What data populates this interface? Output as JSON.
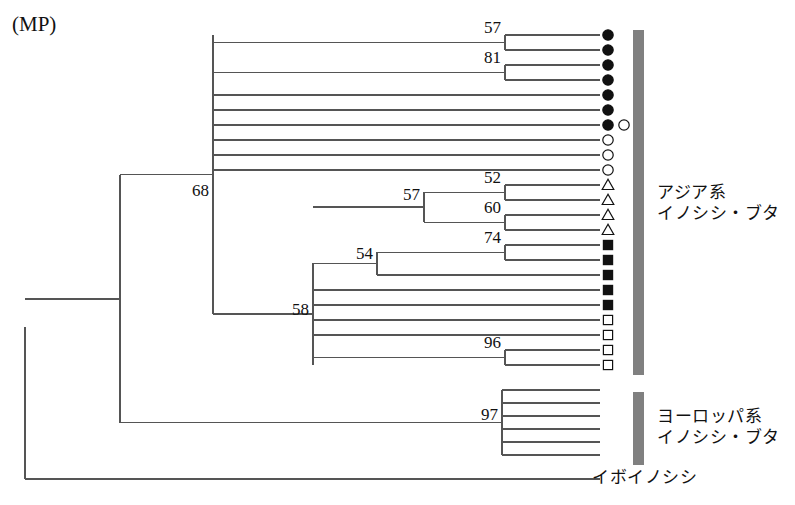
{
  "figure": {
    "method_label": "(MP)",
    "width": 795,
    "height": 505,
    "line_color": "#555555",
    "text_color": "#111111",
    "bar_color": "#808080",
    "background": "#ffffff"
  },
  "groups": [
    {
      "id": "asian",
      "line1": "アジア系",
      "line2": "イノシシ・ブタ",
      "bar": {
        "x": 633,
        "y": 30,
        "width": 11,
        "height": 345
      },
      "label_x": 657,
      "label_y": 182
    },
    {
      "id": "european",
      "line1": "ヨーロッパ系",
      "line2": "イノシシ・ブタ",
      "bar": {
        "x": 633,
        "y": 392,
        "width": 11,
        "height": 73
      },
      "label_x": 657,
      "label_y": 406
    }
  ],
  "outgroup": {
    "id": "warthog",
    "label": "イボイノシシ",
    "label_x": 592,
    "label_y": 479
  },
  "chart_data": {
    "type": "tree",
    "title": "(MP)",
    "tip_count": 30,
    "tip_spacing": 15,
    "first_tip_y": 35,
    "tip_x": 600,
    "marker_x": 608,
    "bootstrap_values": [
      57,
      81,
      68,
      57,
      52,
      60,
      54,
      74,
      58,
      96,
      97
    ],
    "marker_legend": [
      {
        "symbol": "filled-circle",
        "count": 7
      },
      {
        "symbol": "open-circle",
        "count": 4
      },
      {
        "symbol": "open-triangle",
        "count": 4
      },
      {
        "symbol": "filled-square",
        "count": 5
      },
      {
        "symbol": "open-square",
        "count": 4
      },
      {
        "symbol": "none",
        "count": 7
      }
    ],
    "tips": [
      {
        "index": 0,
        "y": 35,
        "marker": "filled-circle",
        "extra_marker": null
      },
      {
        "index": 1,
        "y": 50,
        "marker": "filled-circle",
        "extra_marker": null
      },
      {
        "index": 2,
        "y": 65,
        "marker": "filled-circle",
        "extra_marker": null
      },
      {
        "index": 3,
        "y": 80,
        "marker": "filled-circle",
        "extra_marker": null
      },
      {
        "index": 4,
        "y": 95,
        "marker": "filled-circle",
        "extra_marker": null
      },
      {
        "index": 5,
        "y": 110,
        "marker": "filled-circle",
        "extra_marker": null
      },
      {
        "index": 6,
        "y": 125,
        "marker": "filled-circle",
        "extra_marker": "open-circle"
      },
      {
        "index": 7,
        "y": 140,
        "marker": "open-circle",
        "extra_marker": null
      },
      {
        "index": 8,
        "y": 155,
        "marker": "open-circle",
        "extra_marker": null
      },
      {
        "index": 9,
        "y": 170,
        "marker": "open-circle",
        "extra_marker": null
      },
      {
        "index": 10,
        "y": 185,
        "marker": "open-triangle",
        "extra_marker": null
      },
      {
        "index": 11,
        "y": 200,
        "marker": "open-triangle",
        "extra_marker": null
      },
      {
        "index": 12,
        "y": 215,
        "marker": "open-triangle",
        "extra_marker": null
      },
      {
        "index": 13,
        "y": 230,
        "marker": "open-triangle",
        "extra_marker": null
      },
      {
        "index": 14,
        "y": 245,
        "marker": "filled-square",
        "extra_marker": null
      },
      {
        "index": 15,
        "y": 260,
        "marker": "filled-square",
        "extra_marker": null
      },
      {
        "index": 16,
        "y": 275,
        "marker": "filled-square",
        "extra_marker": null
      },
      {
        "index": 17,
        "y": 290,
        "marker": "filled-square",
        "extra_marker": null
      },
      {
        "index": 18,
        "y": 305,
        "marker": "filled-square",
        "extra_marker": null
      },
      {
        "index": 19,
        "y": 320,
        "marker": "open-square",
        "extra_marker": null
      },
      {
        "index": 20,
        "y": 335,
        "marker": "open-square",
        "extra_marker": null
      },
      {
        "index": 21,
        "y": 350,
        "marker": "open-square",
        "extra_marker": null
      },
      {
        "index": 22,
        "y": 365,
        "marker": "open-square",
        "extra_marker": null
      },
      {
        "index": 23,
        "y": 390,
        "marker": "none",
        "extra_marker": null
      },
      {
        "index": 24,
        "y": 403,
        "marker": "none",
        "extra_marker": null
      },
      {
        "index": 25,
        "y": 416,
        "marker": "none",
        "extra_marker": null
      },
      {
        "index": 26,
        "y": 429,
        "marker": "none",
        "extra_marker": null
      },
      {
        "index": 27,
        "y": 442,
        "marker": "none",
        "extra_marker": null
      },
      {
        "index": 28,
        "y": 455,
        "marker": "none",
        "extra_marker": null
      },
      {
        "index": 29,
        "y": 479,
        "marker": "none",
        "extra_marker": null
      }
    ],
    "nodes": [
      {
        "id": "n57a",
        "x": 505,
        "y_top": 35,
        "y_bot": 50,
        "parent_x": 213,
        "label": "57",
        "label_x": 501,
        "label_y": 33,
        "anchor": "end"
      },
      {
        "id": "n81",
        "x": 505,
        "y_top": 65,
        "y_bot": 80,
        "parent_x": 213,
        "label": "81",
        "label_x": 501,
        "label_y": 63,
        "anchor": "end"
      },
      {
        "id": "n52",
        "x": 505,
        "y_top": 185,
        "y_bot": 200,
        "parent_x": 424,
        "label": "52",
        "label_x": 501,
        "label_y": 183,
        "anchor": "end"
      },
      {
        "id": "n60",
        "x": 505,
        "y_top": 215,
        "y_bot": 230,
        "parent_x": 424,
        "label": "60",
        "label_x": 501,
        "label_y": 213,
        "anchor": "end"
      },
      {
        "id": "n57b",
        "x": 424,
        "y_top": 192,
        "y_bot": 222,
        "parent_x": 313,
        "label": "57",
        "label_x": 420,
        "label_y": 200,
        "anchor": "end"
      },
      {
        "id": "n74",
        "x": 505,
        "y_top": 245,
        "y_bot": 260,
        "parent_x": 377,
        "label": "74",
        "label_x": 501,
        "label_y": 243,
        "anchor": "end"
      },
      {
        "id": "n54",
        "x": 377,
        "y_top": 252,
        "y_bot": 275,
        "parent_x": 313,
        "label": "54",
        "label_x": 373,
        "label_y": 259,
        "anchor": "end"
      },
      {
        "id": "n96",
        "x": 505,
        "y_top": 350,
        "y_bot": 365,
        "parent_x": 313,
        "label": "96",
        "label_x": 501,
        "label_y": 348,
        "anchor": "end"
      },
      {
        "id": "n58",
        "x": 313,
        "y_top": 263,
        "y_bot": 365,
        "parent_x": 213,
        "label": "58",
        "label_x": 309,
        "label_y": 315,
        "anchor": "end"
      },
      {
        "id": "n68",
        "x": 213,
        "y_top": 35,
        "y_bot": 314,
        "parent_x": 120,
        "label": "68",
        "label_x": 209,
        "label_y": 196,
        "anchor": "end"
      },
      {
        "id": "n97",
        "x": 502,
        "y_top": 390,
        "y_bot": 455,
        "parent_x": 120,
        "label": "97",
        "label_x": 498,
        "label_y": 420,
        "anchor": "end"
      },
      {
        "id": "nroot2",
        "x": 120,
        "y_top": 175,
        "y_bot": 423,
        "parent_x": 25,
        "label": null,
        "label_x": 0,
        "label_y": 0,
        "anchor": "end"
      },
      {
        "id": "nroot1",
        "x": 25,
        "y_top": 327,
        "y_bot": 479,
        "parent_x": 25,
        "label": null,
        "label_x": 0,
        "label_y": 0,
        "anchor": "end"
      }
    ],
    "tip_branches": [
      {
        "tip": 0,
        "from_x": 505
      },
      {
        "tip": 1,
        "from_x": 505
      },
      {
        "tip": 2,
        "from_x": 505
      },
      {
        "tip": 3,
        "from_x": 505
      },
      {
        "tip": 4,
        "from_x": 213
      },
      {
        "tip": 5,
        "from_x": 213
      },
      {
        "tip": 6,
        "from_x": 213
      },
      {
        "tip": 7,
        "from_x": 213
      },
      {
        "tip": 8,
        "from_x": 213
      },
      {
        "tip": 9,
        "from_x": 213
      },
      {
        "tip": 10,
        "from_x": 505
      },
      {
        "tip": 11,
        "from_x": 505
      },
      {
        "tip": 12,
        "from_x": 505
      },
      {
        "tip": 13,
        "from_x": 505
      },
      {
        "tip": 14,
        "from_x": 505
      },
      {
        "tip": 15,
        "from_x": 505
      },
      {
        "tip": 16,
        "from_x": 377
      },
      {
        "tip": 17,
        "from_x": 313
      },
      {
        "tip": 18,
        "from_x": 313
      },
      {
        "tip": 19,
        "from_x": 313
      },
      {
        "tip": 20,
        "from_x": 313
      },
      {
        "tip": 21,
        "from_x": 505
      },
      {
        "tip": 22,
        "from_x": 505
      },
      {
        "tip": 23,
        "from_x": 502
      },
      {
        "tip": 24,
        "from_x": 502
      },
      {
        "tip": 25,
        "from_x": 502
      },
      {
        "tip": 26,
        "from_x": 502
      },
      {
        "tip": 27,
        "from_x": 502
      },
      {
        "tip": 28,
        "from_x": 502
      },
      {
        "tip": 29,
        "from_x": 25
      }
    ]
  }
}
